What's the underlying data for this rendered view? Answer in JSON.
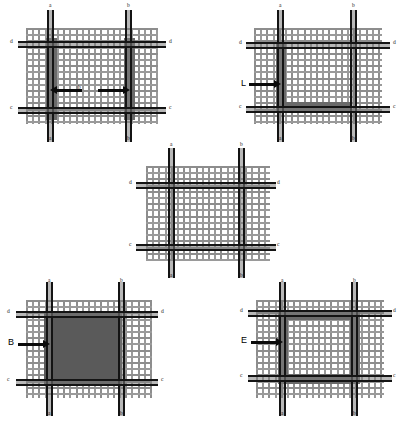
{
  "figure": {
    "colors": {
      "background": "#ffffff",
      "mesh": "#8d8d8d",
      "rail": "#141414",
      "fill_solid": "#5a5a5a",
      "fill_band": "#6a6a6a",
      "annotation": "#0b0b0b"
    },
    "rail_labels": {
      "vertical_left": "a",
      "vertical_right": "b",
      "horizontal_bottom": "c",
      "horizontal_top": "d"
    }
  },
  "panels": [
    {
      "id": "panel-top-left",
      "position": "top-left",
      "shading": "two vertical bands under the a and b rails",
      "callout": {
        "label": "b",
        "type": "dimension-arrow",
        "style": "double-headed"
      },
      "labels": {
        "top_left": "a",
        "top_right": "b",
        "bottom_left": "a",
        "bottom_right": "b",
        "left_upper": "d",
        "right_upper": "d",
        "left_lower": "c",
        "right_lower": "c"
      }
    },
    {
      "id": "panel-top-right",
      "position": "top-right",
      "shading": "L-shaped band along the a rail and the c rail",
      "callout": {
        "label": "L",
        "type": "leader-arrow",
        "style": "single-headed"
      },
      "labels": {
        "top_left": "a",
        "top_right": "b",
        "bottom_left": "a",
        "bottom_right": "b",
        "left_upper": "d",
        "right_upper": "d",
        "left_lower": "c",
        "right_lower": "c"
      }
    },
    {
      "id": "panel-center",
      "position": "center",
      "shading": "none - plain reference mesh",
      "callout": null,
      "labels": {
        "top_left": "a",
        "top_right": "b",
        "bottom_left": "a",
        "bottom_right": "b",
        "left_upper": "d",
        "right_upper": "d",
        "left_lower": "c",
        "right_lower": "c"
      }
    },
    {
      "id": "panel-bottom-left",
      "position": "bottom-left",
      "shading": "fully filled square spanning rails a-b and c-d",
      "callout": {
        "label": "B",
        "type": "leader-arrow",
        "style": "single-headed"
      },
      "labels": {
        "top_left": "a",
        "top_right": "b",
        "bottom_left": "a",
        "bottom_right": "b",
        "left_upper": "d",
        "right_upper": "d",
        "left_lower": "c",
        "right_lower": "c"
      }
    },
    {
      "id": "panel-bottom-right",
      "position": "bottom-right",
      "shading": "hollow square ring (frame) following rails a-b and c-d",
      "callout": {
        "label": "E",
        "type": "leader-arrow",
        "style": "single-headed"
      },
      "labels": {
        "top_left": "a",
        "top_right": "b",
        "bottom_left": "a",
        "bottom_right": "b",
        "left_upper": "d",
        "right_upper": "d",
        "left_lower": "c",
        "right_lower": "c"
      }
    }
  ]
}
